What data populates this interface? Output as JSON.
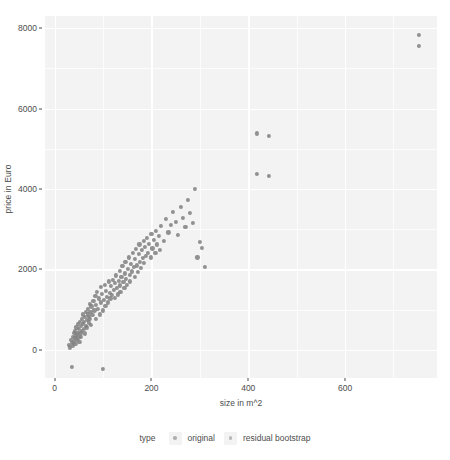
{
  "chart_data": {
    "type": "scatter",
    "title": "",
    "subtitle": "",
    "xlabel": "size in m^2",
    "ylabel": "price in Euro",
    "xlim": [
      -20,
      790
    ],
    "ylim": [
      -700,
      8300
    ],
    "xticks": [
      0,
      200,
      400,
      600
    ],
    "xtick_labels": [
      "0",
      "200",
      "400",
      "600"
    ],
    "yticks": [
      0,
      2000,
      4000,
      6000,
      8000
    ],
    "ytick_labels": [
      "0",
      "2000",
      "4000",
      "6000",
      "8000"
    ],
    "x_minor_ticks": [
      100,
      300,
      500,
      700
    ],
    "y_minor_ticks": [
      1000,
      3000,
      5000,
      7000
    ],
    "grid": true,
    "grid_color": "#ffffff",
    "panel_background": "#f3f3f3",
    "point_color": "#7f7f7f",
    "point_size": 4.2,
    "legend": {
      "position": "bottom",
      "title": "type",
      "entries": [
        {
          "label": "original",
          "color": "#b0b0b0"
        },
        {
          "label": "residual bootstrap",
          "color": "#b8b8b8"
        }
      ]
    },
    "series": [
      {
        "name": "original",
        "color": "#7f7f7f",
        "points": [
          [
            30,
            120
          ],
          [
            32,
            60
          ],
          [
            34,
            250
          ],
          [
            35,
            -430
          ],
          [
            36,
            180
          ],
          [
            37,
            330
          ],
          [
            38,
            90
          ],
          [
            39,
            420
          ],
          [
            40,
            210
          ],
          [
            41,
            300
          ],
          [
            42,
            480
          ],
          [
            43,
            140
          ],
          [
            44,
            360
          ],
          [
            45,
            560
          ],
          [
            46,
            250
          ],
          [
            47,
            430
          ],
          [
            48,
            650
          ],
          [
            49,
            310
          ],
          [
            50,
            520
          ],
          [
            51,
            200
          ],
          [
            52,
            700
          ],
          [
            53,
            410
          ],
          [
            54,
            590
          ],
          [
            55,
            330
          ],
          [
            56,
            760
          ],
          [
            57,
            480
          ],
          [
            58,
            640
          ],
          [
            59,
            880
          ],
          [
            60,
            520
          ],
          [
            61,
            700
          ],
          [
            62,
            410
          ],
          [
            63,
            820
          ],
          [
            64,
            600
          ],
          [
            65,
            950
          ],
          [
            66,
            740
          ],
          [
            67,
            560
          ],
          [
            68,
            880
          ],
          [
            69,
            1020
          ],
          [
            70,
            680
          ],
          [
            71,
            820
          ],
          [
            72,
            1150
          ],
          [
            73,
            760
          ],
          [
            74,
            940
          ],
          [
            75,
            620
          ],
          [
            76,
            1080
          ],
          [
            78,
            860
          ],
          [
            80,
            1210
          ],
          [
            82,
            980
          ],
          [
            84,
            1340
          ],
          [
            85,
            760
          ],
          [
            86,
            1120
          ],
          [
            88,
            1450
          ],
          [
            90,
            1020
          ],
          [
            92,
            1280
          ],
          [
            94,
            880
          ],
          [
            95,
            1560
          ],
          [
            96,
            1180
          ],
          [
            98,
            1390
          ],
          [
            100,
            980
          ],
          [
            100,
            -480
          ],
          [
            102,
            1240
          ],
          [
            104,
            1620
          ],
          [
            105,
            1100
          ],
          [
            106,
            1460
          ],
          [
            108,
            1310
          ],
          [
            110,
            1180
          ],
          [
            112,
            1700
          ],
          [
            114,
            1420
          ],
          [
            115,
            1280
          ],
          [
            116,
            1580
          ],
          [
            118,
            1360
          ],
          [
            120,
            1740
          ],
          [
            122,
            1490
          ],
          [
            124,
            1290
          ],
          [
            125,
            1660
          ],
          [
            126,
            1850
          ],
          [
            128,
            1540
          ],
          [
            130,
            1380
          ],
          [
            132,
            1720
          ],
          [
            134,
            1960
          ],
          [
            135,
            1600
          ],
          [
            136,
            1450
          ],
          [
            138,
            1810
          ],
          [
            140,
            2080
          ],
          [
            142,
            1690
          ],
          [
            144,
            1530
          ],
          [
            145,
            1900
          ],
          [
            146,
            2180
          ],
          [
            148,
            1760
          ],
          [
            150,
            1620
          ],
          [
            152,
            2020
          ],
          [
            154,
            2300
          ],
          [
            155,
            1870
          ],
          [
            156,
            1700
          ],
          [
            158,
            2130
          ],
          [
            160,
            1950
          ],
          [
            162,
            2420
          ],
          [
            164,
            2060
          ],
          [
            165,
            1820
          ],
          [
            166,
            2260
          ],
          [
            168,
            2500
          ],
          [
            170,
            2100
          ],
          [
            172,
            1930
          ],
          [
            174,
            2380
          ],
          [
            175,
            2620
          ],
          [
            176,
            2180
          ],
          [
            178,
            2040
          ],
          [
            180,
            2480
          ],
          [
            182,
            2280
          ],
          [
            184,
            2700
          ],
          [
            185,
            2160
          ],
          [
            186,
            2550
          ],
          [
            188,
            2340
          ],
          [
            190,
            2780
          ],
          [
            192,
            2420
          ],
          [
            195,
            2640
          ],
          [
            198,
            2300
          ],
          [
            200,
            2880
          ],
          [
            202,
            2520
          ],
          [
            205,
            2740
          ],
          [
            208,
            2400
          ],
          [
            210,
            2950
          ],
          [
            212,
            2620
          ],
          [
            215,
            2840
          ],
          [
            218,
            2480
          ],
          [
            220,
            3080
          ],
          [
            225,
            2700
          ],
          [
            230,
            3250
          ],
          [
            235,
            2920
          ],
          [
            240,
            3100
          ],
          [
            245,
            3420
          ],
          [
            250,
            3180
          ],
          [
            255,
            2860
          ],
          [
            260,
            3560
          ],
          [
            265,
            3280
          ],
          [
            270,
            3050
          ],
          [
            275,
            3720
          ],
          [
            280,
            3400
          ],
          [
            285,
            3160
          ],
          [
            290,
            4000
          ],
          [
            295,
            2300
          ],
          [
            300,
            2680
          ],
          [
            305,
            2540
          ],
          [
            310,
            2060
          ]
        ]
      },
      {
        "name": "residual bootstrap",
        "color": "#7f7f7f",
        "points": [
          [
            418,
            5380
          ],
          [
            443,
            5320
          ],
          [
            418,
            4380
          ],
          [
            443,
            4320
          ],
          [
            752,
            7820
          ],
          [
            752,
            7560
          ]
        ]
      }
    ]
  }
}
